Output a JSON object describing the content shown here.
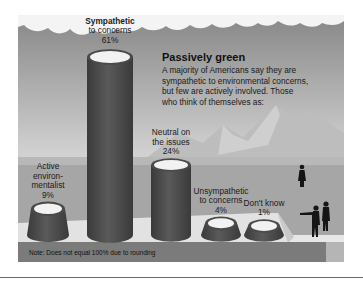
{
  "chart_data": {
    "type": "bar",
    "style": "3d-cylinders",
    "title": "Passively green",
    "subtitle": "A majority of Americans say they are sympathetic to environmental concerns, but few are actively involved. Those who think of themselves as:",
    "subtitle_lines": [
      "A majority of Americans say they are",
      "sympathetic to environmental concerns,",
      "but few are actively involved. Those",
      "who think of themselves as:"
    ],
    "categories": [
      "Active environmentalist",
      "Sympathetic to concerns",
      "Neutral on the issues",
      "Unsympathetic to concerns",
      "Don't know"
    ],
    "label_lines": [
      [
        "Active",
        "environ-",
        "mentalist"
      ],
      [
        "Sympathetic",
        "to concerns"
      ],
      [
        "Neutral on",
        "the issues"
      ],
      [
        "Unsympathetic",
        "to concerns"
      ],
      [
        "Don't know"
      ]
    ],
    "values": [
      9,
      61,
      24,
      4,
      1
    ],
    "value_labels": [
      "9%",
      "61%",
      "24%",
      "4%",
      "1%"
    ],
    "unit": "%",
    "xlabel": "",
    "ylabel": "",
    "ylim": [
      0,
      61
    ],
    "grid": false,
    "legend": "none",
    "note": "Note: Does not equal 100% due to rounding"
  },
  "colors": {
    "sky_top": "#8a8a8a",
    "sky_bottom": "#ececec",
    "mountain": "#bdbdbd",
    "ground": "#a7a7a7",
    "platform_top": "#e3e3e3",
    "platform_side": "#9a9a9a",
    "cylinder_body": "#4f4f4f",
    "cylinder_top": "#f2f2f2",
    "footer_band": "#7b7b7b",
    "text": "#111111"
  }
}
